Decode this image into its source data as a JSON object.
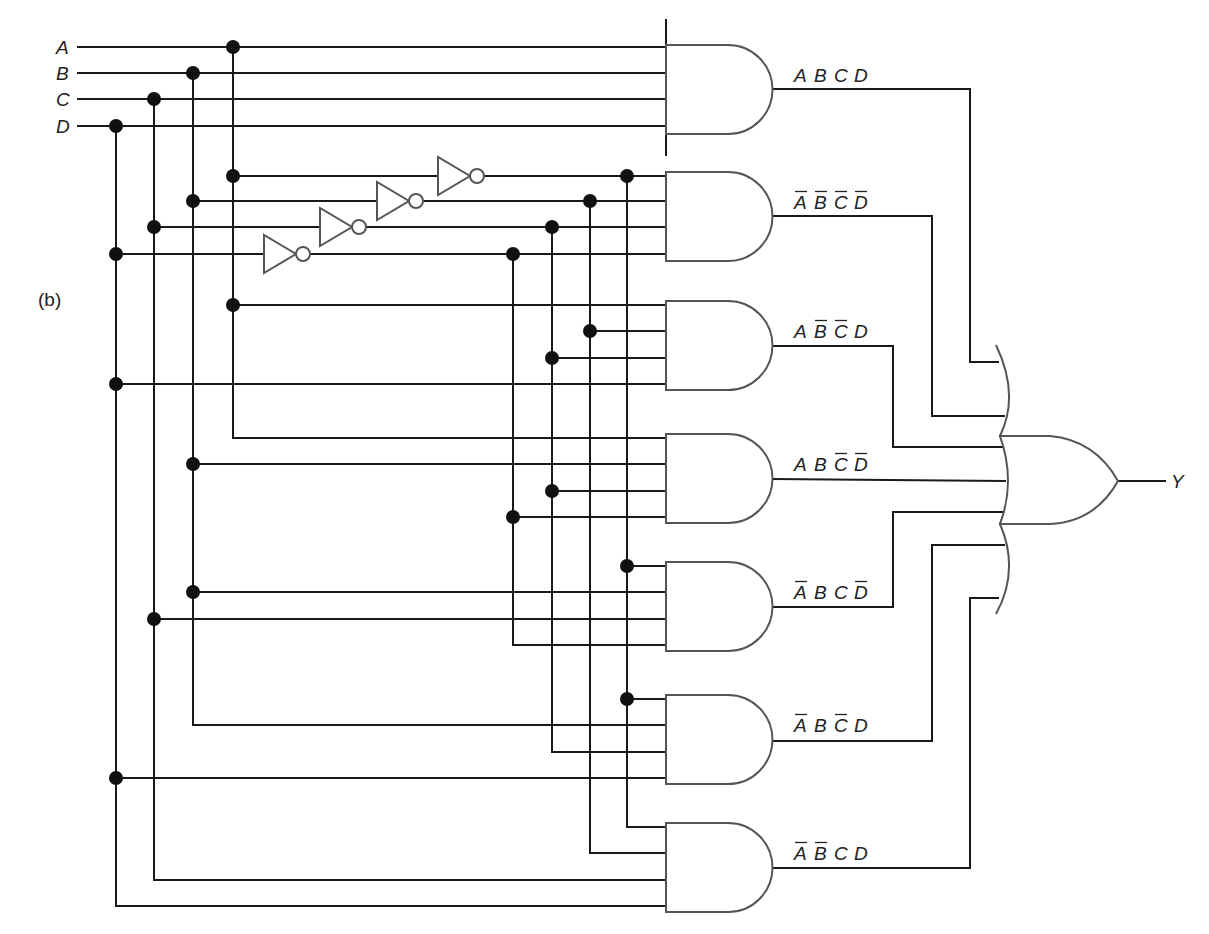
{
  "figure": {
    "part_label": "(b)",
    "inputs": [
      {
        "name": "A",
        "y": 47,
        "bus_x": 233,
        "inv_bus_x": 627,
        "inv_y": 176
      },
      {
        "name": "B",
        "y": 73,
        "bus_x": 193,
        "inv_bus_x": 590,
        "inv_y": 201
      },
      {
        "name": "C",
        "y": 99,
        "bus_x": 154,
        "inv_bus_x": 552,
        "inv_y": 227
      },
      {
        "name": "D",
        "y": 126,
        "bus_x": 116,
        "inv_bus_x": 513,
        "inv_y": 254
      }
    ],
    "and_gates": [
      {
        "id": "g1",
        "terms": [
          {
            "v": "A",
            "bar": false
          },
          {
            "v": "B",
            "bar": false
          },
          {
            "v": "C",
            "bar": false
          },
          {
            "v": "D",
            "bar": false
          }
        ],
        "label": "A B C D"
      },
      {
        "id": "g2",
        "terms": [
          {
            "v": "A",
            "bar": true
          },
          {
            "v": "B",
            "bar": true
          },
          {
            "v": "C",
            "bar": true
          },
          {
            "v": "D",
            "bar": true
          }
        ],
        "label": "A̅ B̅ C̅ D̅"
      },
      {
        "id": "g3",
        "terms": [
          {
            "v": "A",
            "bar": false
          },
          {
            "v": "B",
            "bar": true
          },
          {
            "v": "C",
            "bar": true
          },
          {
            "v": "D",
            "bar": false
          }
        ],
        "label": "A B̅ C̅ D"
      },
      {
        "id": "g4",
        "terms": [
          {
            "v": "A",
            "bar": false
          },
          {
            "v": "B",
            "bar": false
          },
          {
            "v": "C",
            "bar": true
          },
          {
            "v": "D",
            "bar": true
          }
        ],
        "label": "A B C̅ D̅"
      },
      {
        "id": "g5",
        "terms": [
          {
            "v": "A",
            "bar": true
          },
          {
            "v": "B",
            "bar": false
          },
          {
            "v": "C",
            "bar": false
          },
          {
            "v": "D",
            "bar": true
          }
        ],
        "label": "A̅ B C D̅"
      },
      {
        "id": "g6",
        "terms": [
          {
            "v": "A",
            "bar": true
          },
          {
            "v": "B",
            "bar": false
          },
          {
            "v": "C",
            "bar": true
          },
          {
            "v": "D",
            "bar": false
          }
        ],
        "label": "A̅ B C̅ D"
      },
      {
        "id": "g7",
        "terms": [
          {
            "v": "A",
            "bar": true
          },
          {
            "v": "B",
            "bar": true
          },
          {
            "v": "C",
            "bar": false
          },
          {
            "v": "D",
            "bar": false
          }
        ],
        "label": "A̅ B̅ C D"
      }
    ],
    "or_gate": {
      "output_label": "Y"
    },
    "colors": {
      "wire": "#1a1a1a",
      "gate_outline": "#555555",
      "dot": "#111111",
      "background": "#ffffff"
    }
  }
}
